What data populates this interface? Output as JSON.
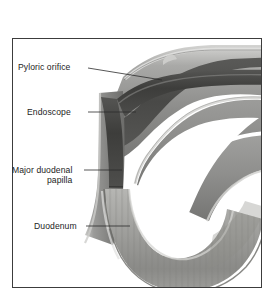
{
  "figure": {
    "kind": "medical-illustration",
    "frame": {
      "border_color": "#3c3c3c",
      "background": "#ffffff"
    },
    "palette": {
      "background": "#ffffff",
      "wall_outer_highlight": "#d8d8d6",
      "wall_mid_gray": "#9a9a9a",
      "wall_dark_gray": "#6e6e6e",
      "lumen_dark": "#4a4a4a",
      "endoscope_dark": "#3f3f3f",
      "mucosa_light": "#c3c3c0",
      "text": "#1d1d1d",
      "leader_line": "#2b2b2b"
    }
  },
  "labels": [
    {
      "id": "pyloric-orifice",
      "text": "Pyloric orifice"
    },
    {
      "id": "endoscope",
      "text": "Endoscope"
    },
    {
      "id": "major-duodenal-papilla",
      "line1": "Major duodenal",
      "line2": "papilla"
    },
    {
      "id": "duodenum",
      "text": "Duodenum"
    }
  ]
}
